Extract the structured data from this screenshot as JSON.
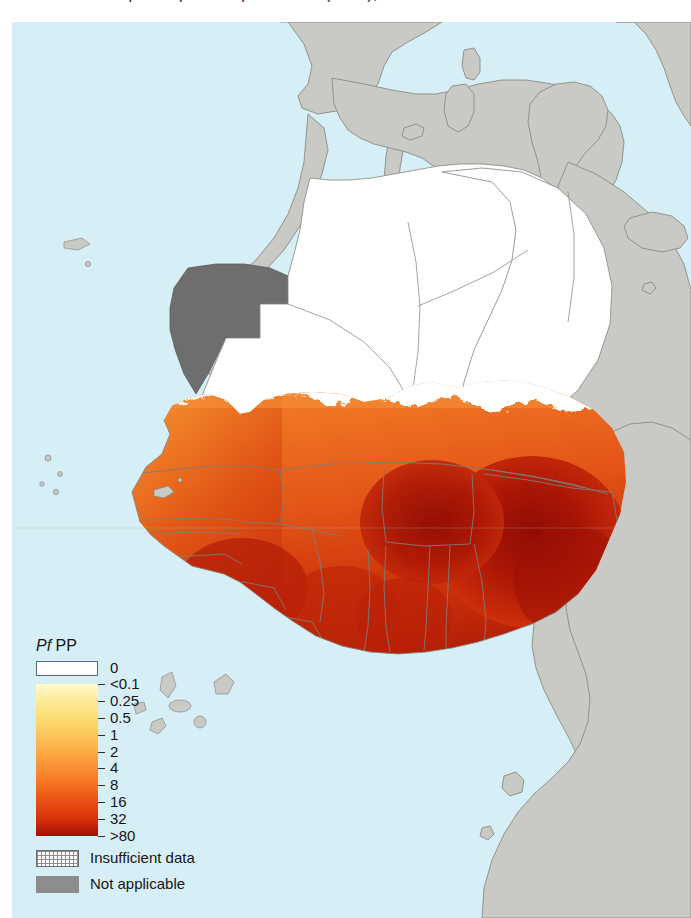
{
  "figure": {
    "title_clipped": "Plasmodium falciparum parasite prevalence (PfPP), West Africa",
    "domain_note": "choropleth / raster prevalence map"
  },
  "legend": {
    "title_italic": "Pf",
    "title_rest": " PP",
    "zero": {
      "label": "0",
      "color": "#ffffff"
    },
    "ticks": [
      {
        "label": "<0.1",
        "color": "#fffbd2"
      },
      {
        "label": "0.25",
        "color": "#fdea96"
      },
      {
        "label": "0.5",
        "color": "#fcdd74"
      },
      {
        "label": "1",
        "color": "#fcc65a"
      },
      {
        "label": "2",
        "color": "#fbab45"
      },
      {
        "label": "4",
        "color": "#f98e34"
      },
      {
        "label": "8",
        "color": "#f4701f"
      },
      {
        "label": "16",
        "color": "#ea4e13"
      },
      {
        "label": "32",
        "color": "#d7300a"
      },
      {
        "label": ">80",
        "color": "#a31003"
      }
    ],
    "extra": [
      {
        "label": "Insufficient data",
        "pattern": "cross-hatch",
        "color": "#8d8d8d"
      },
      {
        "label": "Not applicable",
        "pattern": "solid",
        "color": "#8c8c8c"
      }
    ]
  },
  "colors": {
    "ocean": "#d6eef5",
    "land_not_applicable": "#c9c9c5",
    "land_not_applicable_dark": "#6e6e6e",
    "land_zero": "#ffffff",
    "border_line": "#8a8a85",
    "coast_line": "#8a8a85"
  },
  "chart_data": {
    "type": "heatmap",
    "title": "Plasmodium falciparum parasite prevalence (PfPP), West Africa",
    "legend_title": "PfPP",
    "units": "percent",
    "categories": [
      "0",
      "<0.1",
      "0.25",
      "0.5",
      "1",
      "2",
      "4",
      "8",
      "16",
      "32",
      ">80"
    ],
    "values": [
      0,
      0.1,
      0.25,
      0.5,
      1,
      2,
      4,
      8,
      16,
      32,
      80
    ],
    "colormap": [
      "#ffffff",
      "#fffbd2",
      "#fdea96",
      "#fcdd74",
      "#fcc65a",
      "#fbab45",
      "#f98e34",
      "#f4701f",
      "#ea4e13",
      "#d7300a",
      "#a31003"
    ],
    "special_categories": [
      "Insufficient data",
      "Not applicable"
    ],
    "region": "West Africa and the Sahel",
    "legend_position": "lower-left",
    "grid": false,
    "regions": [
      {
        "name": "Nigeria",
        "band": ">80"
      },
      {
        "name": "Burkina Faso",
        "band": ">80"
      },
      {
        "name": "Benin",
        "band": ">80"
      },
      {
        "name": "Togo",
        "band": "32"
      },
      {
        "name": "Ghana",
        "band": "32"
      },
      {
        "name": "Cote d'Ivoire",
        "band": "32"
      },
      {
        "name": "Guinea",
        "band": "32"
      },
      {
        "name": "Sierra Leone",
        "band": "32"
      },
      {
        "name": "Liberia",
        "band": "32"
      },
      {
        "name": "Mali",
        "band": "16"
      },
      {
        "name": "Niger",
        "band": "16"
      },
      {
        "name": "Senegal",
        "band": "4"
      },
      {
        "name": "Gambia",
        "band": "8"
      },
      {
        "name": "Guinea-Bissau",
        "band": "16"
      },
      {
        "name": "Mauritania",
        "band": "0"
      },
      {
        "name": "Algeria",
        "band": "0"
      },
      {
        "name": "Western Sahara",
        "band": "Not applicable"
      },
      {
        "name": "Morocco",
        "band": "Not applicable"
      },
      {
        "name": "Tunisia",
        "band": "Not applicable"
      },
      {
        "name": "Libya",
        "band": "Not applicable"
      },
      {
        "name": "Chad",
        "band": "Not applicable"
      },
      {
        "name": "Cameroon",
        "band": "Not applicable"
      },
      {
        "name": "Gabon",
        "band": "Not applicable"
      },
      {
        "name": "Congo",
        "band": "Not applicable"
      },
      {
        "name": "Spain",
        "band": "Not applicable"
      },
      {
        "name": "Portugal",
        "band": "Not applicable"
      },
      {
        "name": "Italy",
        "band": "Not applicable"
      }
    ]
  }
}
